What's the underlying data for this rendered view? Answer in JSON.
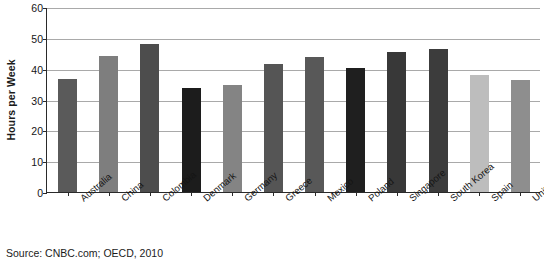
{
  "chart_data": {
    "type": "bar",
    "title": "",
    "subtitle": "",
    "xlabel": "",
    "ylabel": "Hours per Week",
    "ylim": [
      0,
      60
    ],
    "yticks": [
      0,
      10,
      20,
      30,
      40,
      50,
      60
    ],
    "ytick_labels": [
      "0",
      "10",
      "20",
      "30",
      "40",
      "50",
      "60"
    ],
    "grid": true,
    "legend": false,
    "legend_position": "none",
    "categories": [
      "Australia",
      "China",
      "Colombia",
      "Denmark",
      "Germany",
      "Greece",
      "Mexico",
      "Poland",
      "Singapore",
      "South Korea",
      "Spain",
      "United Kingdom"
    ],
    "values": [
      36.5,
      44.0,
      48.0,
      33.8,
      34.8,
      41.5,
      43.8,
      40.3,
      45.5,
      46.3,
      38.0,
      36.2
    ],
    "bar_colors": [
      "#5a5a5a",
      "#7e7e7e",
      "#4d4d4d",
      "#1c1c1c",
      "#848484",
      "#555555",
      "#585858",
      "#1f1f1f",
      "#383838",
      "#3c3c3c",
      "#bdbdbd",
      "#8e8e8e"
    ],
    "annotations": []
  },
  "source_note": "Source:  CNBC.com; OECD, 2010"
}
